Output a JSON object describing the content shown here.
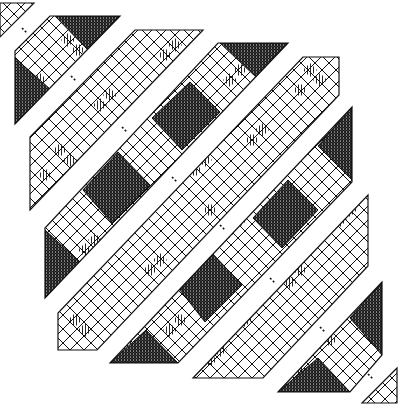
{
  "diagram": {
    "title": "",
    "colors": {
      "ink": "#111111",
      "paper": "#ffffff"
    },
    "bands": [
      {
        "id": "band-1",
        "points": "0,3 34,3 0,37"
      },
      {
        "id": "band-2",
        "points": "50,16 120,16 15,124 15,51"
      },
      {
        "id": "band-3",
        "points": "135,30 203,30 30,210 30,137"
      },
      {
        "id": "band-4",
        "points": "218,43 288,43 45,298 45,228"
      },
      {
        "id": "band-5",
        "points": "303,57 339,57 339,95 97,350 58,350 58,313"
      },
      {
        "id": "band-6",
        "points": "352,107 352,182 178,363 110,363"
      },
      {
        "id": "band-7",
        "points": "368,195 368,266 263,378 193,378"
      },
      {
        "id": "band-8",
        "points": "382,282 382,355 350,392 278,392"
      },
      {
        "id": "band-9",
        "points": "397,368 397,403 362,403"
      }
    ],
    "dark_regions": [
      {
        "band": "band-2",
        "points": "55,16 120,16 88,50"
      },
      {
        "band": "band-2",
        "points": "15,58 15,124 50,89"
      },
      {
        "band": "band-3",
        "points": "118,152 150,185 112,223 83,190"
      },
      {
        "band": "band-4",
        "points": "220,43 288,43 256,77"
      },
      {
        "band": "band-4",
        "points": "190,82 220,112 182,150 152,118"
      },
      {
        "band": "band-4",
        "points": "45,230 45,298 80,262"
      },
      {
        "band": "band-5",
        "points": "212,253 242,285 205,322 180,290"
      },
      {
        "band": "band-6",
        "points": "352,107 352,180 318,146"
      },
      {
        "band": "band-6",
        "points": "288,180 318,210 282,248 253,218"
      },
      {
        "band": "band-6",
        "points": "110,363 178,363 146,330"
      },
      {
        "band": "band-8",
        "points": "382,282 382,355 350,318"
      },
      {
        "band": "band-8",
        "points": "278,392 350,392 318,358"
      }
    ],
    "hatched_cells": [
      [
        68,
        40
      ],
      [
        78,
        50
      ],
      [
        40,
        80
      ],
      [
        175,
        45
      ],
      [
        165,
        55
      ],
      [
        190,
        60
      ],
      [
        110,
        95
      ],
      [
        100,
        105
      ],
      [
        60,
        150
      ],
      [
        70,
        160
      ],
      [
        45,
        175
      ],
      [
        240,
        70
      ],
      [
        230,
        80
      ],
      [
        205,
        160
      ],
      [
        195,
        170
      ],
      [
        95,
        240
      ],
      [
        85,
        250
      ],
      [
        310,
        70
      ],
      [
        320,
        80
      ],
      [
        300,
        90
      ],
      [
        262,
        130
      ],
      [
        252,
        140
      ],
      [
        210,
        210
      ],
      [
        160,
        260
      ],
      [
        150,
        270
      ],
      [
        75,
        320
      ],
      [
        85,
        330
      ],
      [
        330,
        150
      ],
      [
        240,
        220
      ],
      [
        228,
        232
      ],
      [
        180,
        320
      ],
      [
        170,
        330
      ],
      [
        130,
        345
      ],
      [
        350,
        210
      ],
      [
        340,
        220
      ],
      [
        300,
        270
      ],
      [
        290,
        282
      ],
      [
        245,
        320
      ],
      [
        210,
        360
      ],
      [
        220,
        350
      ],
      [
        360,
        300
      ],
      [
        330,
        340
      ],
      [
        300,
        370
      ]
    ],
    "arrows": [
      {
        "x1": 22,
        "y1": 28,
        "x2": 27,
        "y2": 33
      },
      {
        "x1": 71,
        "y1": 76,
        "x2": 76,
        "y2": 81
      },
      {
        "x1": 122,
        "y1": 127,
        "x2": 127,
        "y2": 132
      },
      {
        "x1": 172,
        "y1": 177,
        "x2": 177,
        "y2": 182
      },
      {
        "x1": 220,
        "y1": 225,
        "x2": 225,
        "y2": 230
      },
      {
        "x1": 270,
        "y1": 278,
        "x2": 275,
        "y2": 283
      },
      {
        "x1": 320,
        "y1": 327,
        "x2": 325,
        "y2": 332
      },
      {
        "x1": 368,
        "y1": 374,
        "x2": 373,
        "y2": 379
      }
    ]
  }
}
